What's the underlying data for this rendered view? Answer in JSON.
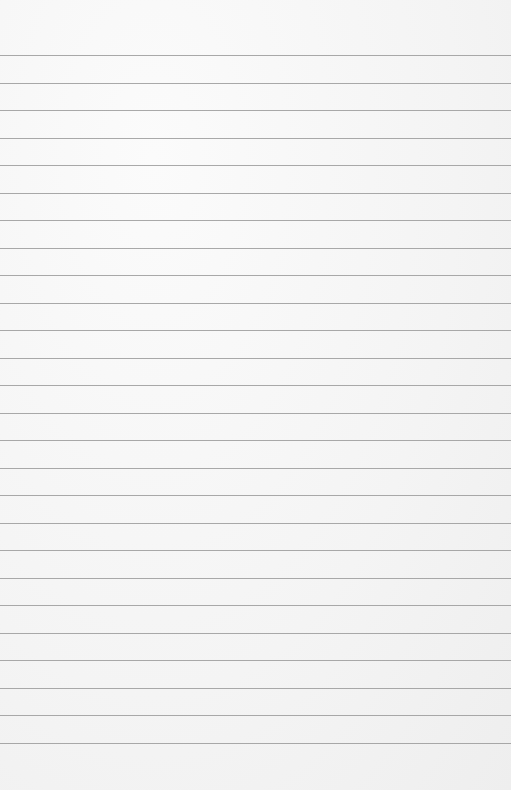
{
  "paper": {
    "description": "Blank lined notebook paper",
    "line_count": 26,
    "first_line_y": 55,
    "line_spacing": 27.52,
    "line_color": "#9a9a9a",
    "background_color": "#f5f5f5"
  }
}
